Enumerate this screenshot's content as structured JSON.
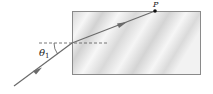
{
  "diagram": {
    "labels": {
      "angle": "θ",
      "angle_subscript": "1",
      "point": "P"
    },
    "colors": {
      "ray": "#6b6b6b",
      "block_border": "#8a8a8a",
      "block_fill_light": "#f4f4f4",
      "block_fill_dark": "#d6d6d6",
      "normal_line": "#555555",
      "point": "#111111"
    }
  }
}
